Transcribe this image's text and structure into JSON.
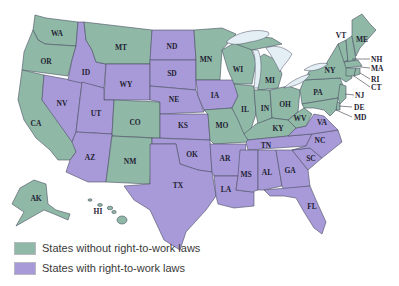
{
  "legend": {
    "without": {
      "label": "States without right-to-work laws",
      "color": "#8fb9a6"
    },
    "with": {
      "label": "States with right-to-work laws",
      "color": "#a89ad8"
    }
  },
  "states": {
    "without_right_to_work": [
      "WA",
      "OR",
      "CA",
      "MT",
      "CO",
      "NM",
      "MN",
      "WI",
      "MI",
      "IL",
      "IN",
      "OH",
      "MO",
      "KY",
      "WV",
      "PA",
      "NY",
      "VT",
      "ME",
      "NH",
      "MA",
      "RI",
      "CT",
      "NJ",
      "DE",
      "MD",
      "AK",
      "HI"
    ],
    "with_right_to_work": [
      "ID",
      "NV",
      "UT",
      "AZ",
      "WY",
      "ND",
      "SD",
      "NE",
      "KS",
      "OK",
      "TX",
      "IA",
      "AR",
      "LA",
      "MS",
      "AL",
      "TN",
      "GA",
      "SC",
      "NC",
      "VA",
      "FL"
    ]
  },
  "labels": {
    "WA": "WA",
    "OR": "OR",
    "CA": "CA",
    "MT": "MT",
    "ID": "ID",
    "NV": "NV",
    "UT": "UT",
    "AZ": "AZ",
    "WY": "WY",
    "CO": "CO",
    "NM": "NM",
    "ND": "ND",
    "SD": "SD",
    "NE": "NE",
    "KS": "KS",
    "OK": "OK",
    "TX": "TX",
    "MN": "MN",
    "IA": "IA",
    "MO": "MO",
    "AR": "AR",
    "LA": "LA",
    "WI": "WI",
    "IL": "IL",
    "MI": "MI",
    "IN": "IN",
    "OH": "OH",
    "KY": "KY",
    "TN": "TN",
    "MS": "MS",
    "AL": "AL",
    "GA": "GA",
    "FL": "FL",
    "SC": "SC",
    "NC": "NC",
    "VA": "VA",
    "WV": "WV",
    "PA": "PA",
    "NY": "NY",
    "VT": "VT",
    "ME": "ME",
    "NH": "NH",
    "MA": "MA",
    "RI": "RI",
    "CT": "CT",
    "NJ": "NJ",
    "DE": "DE",
    "MD": "MD",
    "AK": "AK",
    "HI": "HI"
  }
}
